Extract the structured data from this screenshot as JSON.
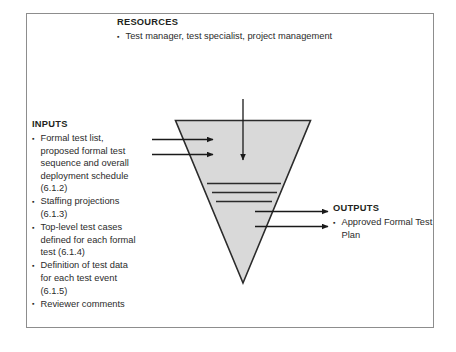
{
  "diagram": {
    "shape": "inverted-triangle",
    "colors": {
      "frame_border": "#8d8d8d",
      "triangle_fill": "#d9d9d9",
      "triangle_stroke": "#2b2b2b",
      "arrow": "#1a1a1a",
      "text": "#231f20"
    }
  },
  "resources": {
    "heading": "RESOURCES",
    "items": [
      "Test manager, test specialist, project management"
    ]
  },
  "inputs": {
    "heading": "INPUTS",
    "items": [
      "Formal test list, proposed formal test sequence and overall deployment schedule (6.1.2)",
      "Staffing projections (6.1.3)",
      "Top-level test cases defined for each formal test (6.1.4)",
      "Definition of test data for each test event (6.1.5)",
      "Reviewer comments"
    ]
  },
  "outputs": {
    "heading": "OUTPUTS",
    "items": [
      "Approved Formal Test Plan"
    ]
  },
  "arrows": {
    "resources_down": "resources-arrow-down",
    "inputs_in": [
      "input-arrow-1",
      "input-arrow-2"
    ],
    "outputs_out": [
      "output-arrow-1",
      "output-arrow-2"
    ]
  },
  "process_lines": {
    "count": 3,
    "name": "process-step-lines"
  }
}
